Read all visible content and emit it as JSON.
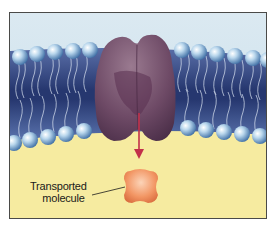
{
  "diagram": {
    "regions": {
      "extracellular": {
        "color": "#d6e8f0"
      },
      "membrane_core": {
        "color": "#2d3f7a"
      },
      "cytoplasm": {
        "color": "#f6eba0"
      }
    },
    "elements": {
      "protein": {
        "name": "transport-protein",
        "color": "#6e4a66"
      },
      "arrow": {
        "name": "transport-arrow",
        "color": "#c2304a"
      },
      "molecule": {
        "name": "transported-molecule",
        "color": "#f08a5a"
      },
      "phospholipid_heads": {
        "color": "#9cc4e2"
      }
    },
    "labels": {
      "molecule_line1": "Transported",
      "molecule_line2": "molecule"
    }
  }
}
